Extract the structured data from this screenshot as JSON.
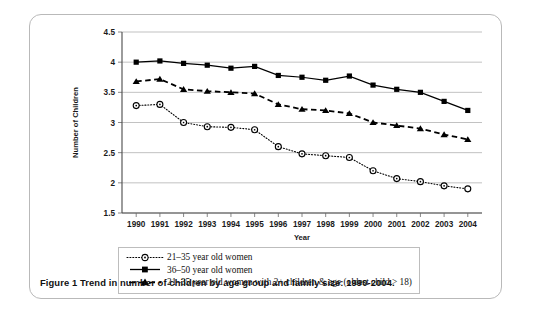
{
  "caption": "Figure 1 Trend in number of children by age group and family size: 1990-2004.",
  "axis": {
    "xlabel": "Year",
    "ylabel": "Number of Children"
  },
  "legend": {
    "items": [
      {
        "marker": "open-circle-dotted",
        "label": "21–35 year old women"
      },
      {
        "marker": "filled-square-solid",
        "label": "36–50 year old women"
      },
      {
        "marker": "filled-triangle-dashed",
        "label": "21–35 year old women with 2+ children & age (oldest child > 18)"
      }
    ]
  },
  "chart_data": {
    "type": "line",
    "title": "Trend in number of children by age group and family size: 1990-2004",
    "xlabel": "Year",
    "ylabel": "Number of Children",
    "categories": [
      "1990",
      "1991",
      "1992",
      "1993",
      "1994",
      "1995",
      "1996",
      "1997",
      "1998",
      "1999",
      "2000",
      "2001",
      "2002",
      "2003",
      "2004"
    ],
    "x": [
      1990,
      1991,
      1992,
      1993,
      1994,
      1995,
      1996,
      1997,
      1998,
      1999,
      2000,
      2001,
      2002,
      2003,
      2004
    ],
    "xlim": [
      1989.4,
      2004.6
    ],
    "ylim": [
      1.5,
      4.5
    ],
    "yticks": [
      1.5,
      2,
      2.5,
      3,
      3.5,
      4,
      4.5
    ],
    "ytick_labels": [
      "1.5",
      "2",
      "2.5",
      "3",
      "3.5",
      "4",
      "4.5"
    ],
    "grid": true,
    "legend_position": "bottom",
    "series": [
      {
        "name": "21–35 year old women",
        "marker": "open-circle",
        "linestyle": "dotted",
        "values": [
          3.28,
          3.3,
          3.0,
          2.93,
          2.92,
          2.88,
          2.6,
          2.48,
          2.45,
          2.42,
          2.2,
          2.07,
          2.02,
          1.95,
          1.9
        ]
      },
      {
        "name": "36–50 year old women",
        "marker": "filled-square",
        "linestyle": "solid",
        "values": [
          4.0,
          4.02,
          3.98,
          3.95,
          3.9,
          3.93,
          3.78,
          3.75,
          3.7,
          3.77,
          3.62,
          3.55,
          3.5,
          3.35,
          3.2
        ]
      },
      {
        "name": "21–35 year old women with 2+ children & age (oldest child > 18)",
        "marker": "filled-triangle",
        "linestyle": "dashed",
        "values": [
          3.68,
          3.72,
          3.55,
          3.52,
          3.5,
          3.48,
          3.3,
          3.22,
          3.2,
          3.15,
          3.0,
          2.95,
          2.9,
          2.8,
          2.72
        ]
      }
    ]
  }
}
